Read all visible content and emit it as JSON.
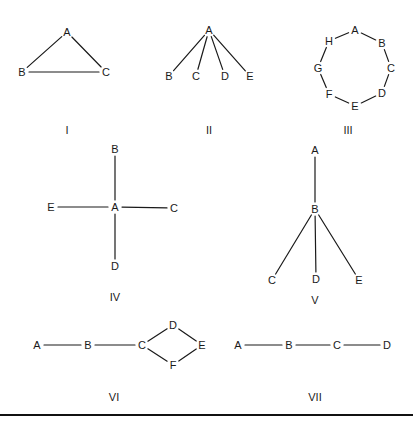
{
  "figure": {
    "width": 413,
    "height": 429,
    "colors": {
      "ink": "#1a1a1a",
      "background": "#ffffff",
      "rule": "#111111"
    },
    "bottom_rule": {
      "y": 415,
      "x1": 0,
      "x2": 413
    },
    "networks": [
      {
        "id": "I",
        "caption": "I",
        "caption_pos": [
          67,
          130
        ],
        "nodes": [
          {
            "id": "A",
            "x": 67,
            "y": 32
          },
          {
            "id": "B",
            "x": 22,
            "y": 72
          },
          {
            "id": "C",
            "x": 106,
            "y": 72
          }
        ],
        "edges": [
          [
            "A",
            "B"
          ],
          [
            "A",
            "C"
          ],
          [
            "B",
            "C"
          ]
        ]
      },
      {
        "id": "II",
        "caption": "II",
        "caption_pos": [
          209,
          130
        ],
        "nodes": [
          {
            "id": "A",
            "x": 209,
            "y": 30
          },
          {
            "id": "B",
            "x": 169,
            "y": 76
          },
          {
            "id": "C",
            "x": 196,
            "y": 76
          },
          {
            "id": "D",
            "x": 225,
            "y": 76
          },
          {
            "id": "E",
            "x": 250,
            "y": 76
          }
        ],
        "edges": [
          [
            "A",
            "B"
          ],
          [
            "A",
            "C"
          ],
          [
            "A",
            "D"
          ],
          [
            "A",
            "E"
          ]
        ]
      },
      {
        "id": "III",
        "caption": "III",
        "caption_pos": [
          348,
          130
        ],
        "nodes": [
          {
            "id": "A",
            "x": 355,
            "y": 30
          },
          {
            "id": "B",
            "x": 382,
            "y": 43
          },
          {
            "id": "C",
            "x": 391,
            "y": 68
          },
          {
            "id": "D",
            "x": 382,
            "y": 93
          },
          {
            "id": "E",
            "x": 355,
            "y": 106
          },
          {
            "id": "F",
            "x": 329,
            "y": 94
          },
          {
            "id": "G",
            "x": 318,
            "y": 68
          },
          {
            "id": "H",
            "x": 329,
            "y": 41
          }
        ],
        "edges": [
          [
            "A",
            "B"
          ],
          [
            "B",
            "C"
          ],
          [
            "C",
            "D"
          ],
          [
            "D",
            "E"
          ],
          [
            "E",
            "F"
          ],
          [
            "F",
            "G"
          ],
          [
            "G",
            "H"
          ],
          [
            "H",
            "A"
          ]
        ]
      },
      {
        "id": "IV",
        "caption": "IV",
        "caption_pos": [
          115,
          297
        ],
        "nodes": [
          {
            "id": "B",
            "x": 115,
            "y": 149
          },
          {
            "id": "E",
            "x": 51,
            "y": 207
          },
          {
            "id": "A",
            "x": 115,
            "y": 207
          },
          {
            "id": "C",
            "x": 174,
            "y": 208
          },
          {
            "id": "D",
            "x": 115,
            "y": 266
          }
        ],
        "edges": [
          [
            "A",
            "B"
          ],
          [
            "A",
            "E"
          ],
          [
            "A",
            "C"
          ],
          [
            "A",
            "D"
          ]
        ]
      },
      {
        "id": "V",
        "caption": "V",
        "caption_pos": [
          315,
          300
        ],
        "nodes": [
          {
            "id": "A",
            "x": 315,
            "y": 150
          },
          {
            "id": "B",
            "x": 315,
            "y": 209
          },
          {
            "id": "C",
            "x": 272,
            "y": 280
          },
          {
            "id": "D",
            "x": 316,
            "y": 279
          },
          {
            "id": "E",
            "x": 359,
            "y": 280
          }
        ],
        "edges": [
          [
            "A",
            "B"
          ],
          [
            "B",
            "C"
          ],
          [
            "B",
            "D"
          ],
          [
            "B",
            "E"
          ]
        ]
      },
      {
        "id": "VI",
        "caption": "VI",
        "caption_pos": [
          114,
          397
        ],
        "nodes": [
          {
            "id": "A",
            "x": 37,
            "y": 345
          },
          {
            "id": "B",
            "x": 88,
            "y": 345
          },
          {
            "id": "C",
            "x": 142,
            "y": 345
          },
          {
            "id": "D",
            "x": 173,
            "y": 325
          },
          {
            "id": "E",
            "x": 202,
            "y": 345
          },
          {
            "id": "F",
            "x": 173,
            "y": 365
          }
        ],
        "edges": [
          [
            "A",
            "B"
          ],
          [
            "B",
            "C"
          ],
          [
            "C",
            "D"
          ],
          [
            "D",
            "E"
          ],
          [
            "E",
            "F"
          ],
          [
            "F",
            "C"
          ]
        ]
      },
      {
        "id": "VII",
        "caption": "VII",
        "caption_pos": [
          315,
          397
        ],
        "nodes": [
          {
            "id": "A",
            "x": 238,
            "y": 345
          },
          {
            "id": "B",
            "x": 289,
            "y": 345
          },
          {
            "id": "C",
            "x": 337,
            "y": 345
          },
          {
            "id": "D",
            "x": 387,
            "y": 345
          }
        ],
        "edges": [
          [
            "A",
            "B"
          ],
          [
            "B",
            "C"
          ],
          [
            "C",
            "D"
          ]
        ]
      }
    ]
  }
}
